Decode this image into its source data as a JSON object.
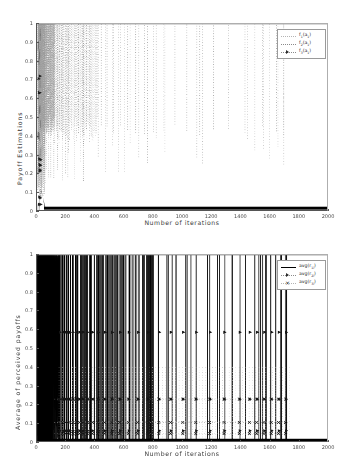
{
  "figures": [
    {
      "id": "payoff-estimations",
      "chart_data": {
        "type": "line",
        "title": "",
        "xlabel": "Number of iterations",
        "ylabel": "Payoff Estimations",
        "xlim": [
          0,
          2000
        ],
        "ylim": [
          0,
          1
        ],
        "xticks": [
          0,
          200,
          400,
          600,
          800,
          1000,
          1200,
          1400,
          1600,
          1800,
          2000
        ],
        "xticklabels": [
          "0",
          "200",
          "400",
          "600",
          "800",
          "1000",
          "1200",
          "1400",
          "1600",
          "1800",
          "2000"
        ],
        "yticks": [
          0,
          0.1,
          0.2,
          0.3,
          0.4,
          0.5,
          0.6,
          0.7,
          0.8,
          0.9,
          1
        ],
        "yticklabels": [
          "0",
          "0.1",
          "0.2",
          "0.3",
          "0.4",
          "0.5",
          "0.6",
          "0.7",
          "0.8",
          "0.9",
          "1"
        ],
        "grid": false,
        "legend_position": "upper right",
        "legend": [
          {
            "label": "f1(a1)",
            "style": "dotted",
            "marker": "none",
            "color": "#b4b4b4"
          },
          {
            "label": "f2(a1)",
            "style": "dotted",
            "marker": "none",
            "color": "#9e9e9e"
          },
          {
            "label": "f3(a1)",
            "style": "dotted",
            "marker": "triangle",
            "color": "#8a8a8a"
          }
        ],
        "series": [
          {
            "name": "f1(a1)",
            "description": "Dense dotted vertical excursions spanning 0.4 to 1.0, concentrated below 400 iterations and thinning out to isolated spikes up to 1700 iterations",
            "spike_x": [
              8,
              12,
              15,
              18,
              21,
              24,
              27,
              30,
              33,
              36,
              39,
              42,
              45,
              48,
              52,
              56,
              60,
              64,
              68,
              73,
              78,
              84,
              90,
              97,
              104,
              112,
              121,
              131,
              142,
              154,
              168,
              183,
              200,
              218,
              238,
              260,
              284,
              310,
              339,
              370,
              404,
              441,
              481,
              525,
              572,
              623,
              678,
              738,
              803,
              873,
              949,
              1031,
              1120,
              1216,
              1320,
              1432,
              1553,
              1650,
              1700
            ],
            "spike_low": 0.4,
            "spike_high": 1.0
          },
          {
            "name": "f2(a1)",
            "description": "Dotted trace clustered near the left edge with points between 0.15 and 1.0",
            "spike_x": [
              6,
              10,
              14,
              19,
              25,
              32,
              40,
              50,
              62,
              76,
              93,
              114,
              140,
              172,
              211,
              259,
              318
            ],
            "spike_low": 0.15,
            "spike_high": 1.0
          },
          {
            "name": "f3(a1)",
            "description": "Triangle-marked samples near the left axis at roughly 0.72, 0.63, 0.27, 0.24, 0.21, 0.07, 0.03 then collapsing onto the zero baseline",
            "marker_points": [
              {
                "x": 22,
                "y": 0.72
              },
              {
                "x": 20,
                "y": 0.63
              },
              {
                "x": 26,
                "y": 0.27
              },
              {
                "x": 24,
                "y": 0.24
              },
              {
                "x": 22,
                "y": 0.215
              },
              {
                "x": 18,
                "y": 0.07
              },
              {
                "x": 16,
                "y": 0.03
              }
            ],
            "baseline_y": 0.012,
            "baseline_from_x": 60,
            "baseline_to_x": 2000
          }
        ]
      }
    },
    {
      "id": "average-perceived-payoffs",
      "chart_data": {
        "type": "line",
        "title": "",
        "xlabel": "Number of iterations",
        "ylabel": "Average of perceived payoffs",
        "xlim": [
          0,
          2000
        ],
        "ylim": [
          0,
          1
        ],
        "xticks": [
          0,
          200,
          400,
          600,
          800,
          1000,
          1200,
          1400,
          1600,
          1800,
          2000
        ],
        "xticklabels": [
          "0",
          "200",
          "400",
          "600",
          "800",
          "1000",
          "1200",
          "1400",
          "1600",
          "1800",
          "2000"
        ],
        "yticks": [
          0,
          0.1,
          0.2,
          0.3,
          0.4,
          0.5,
          0.6,
          0.7,
          0.8,
          0.9,
          1
        ],
        "yticklabels": [
          "0",
          "0.1",
          "0.2",
          "0.3",
          "0.4",
          "0.5",
          "0.6",
          "0.7",
          "0.8",
          "0.9",
          "1"
        ],
        "grid": false,
        "legend_position": "upper right",
        "legend": [
          {
            "label": "avg(r1i)",
            "style": "solid",
            "marker": "none",
            "color": "#000000"
          },
          {
            "label": "avg(r2i)",
            "style": "dashed",
            "marker": "triangle",
            "color": "#2b2b2b"
          },
          {
            "label": "avg(r3i)",
            "style": "dotted",
            "marker": "x",
            "color": "#2b2b2b"
          }
        ],
        "series": [
          {
            "name": "avg(r1i)",
            "description": "Solid black vertical spikes running the full 0 to 1 range; extremely dense before 200 iterations, gradually sparser, last spike near 1720",
            "spike_x": [
              6,
              9,
              12,
              14,
              16,
              18,
              20,
              22,
              24,
              26,
              28,
              30,
              32,
              34,
              36,
              38,
              40,
              42,
              44,
              47,
              50,
              53,
              56,
              59,
              62,
              66,
              70,
              74,
              78,
              83,
              88,
              93,
              99,
              105,
              112,
              119,
              127,
              135,
              144,
              154,
              164,
              175,
              187,
              200,
              214,
              229,
              245,
              262,
              280,
              300,
              321,
              344,
              368,
              394,
              422,
              452,
              484,
              518,
              555,
              594,
              636,
              681,
              729,
              780,
              835,
              894,
              957,
              1024,
              1096,
              1173,
              1255,
              1343,
              1437,
              1500,
              1540,
              1575,
              1610,
              1645,
              1680,
              1720
            ],
            "spike_low": 0.0,
            "spike_high": 1.0
          },
          {
            "name": "avg(r2i)",
            "description": "Triangle markers at a steady level near 0.58 plus lower clusters near 0.22 and 0.05",
            "marker_levels": [
              0.585,
              0.225,
              0.055
            ],
            "marker_x": [
              160,
              185,
              200,
              215,
              230,
              250,
              270,
              295,
              320,
              350,
              385,
              425,
              470,
              520,
              575,
              635,
              700,
              770,
              845,
              925,
              1010,
              1100,
              1195,
              1295,
              1400,
              1470,
              1520,
              1570,
              1620,
              1670,
              1720
            ]
          },
          {
            "name": "avg(r3i)",
            "description": "Cross markers clustered near 0.22, 0.10 and 0.04 with dotted connectors",
            "marker_levels": [
              0.225,
              0.1,
              0.04
            ],
            "marker_x": [
              150,
              175,
              195,
              210,
              228,
              248,
              268,
              292,
              318,
              348,
              382,
              420,
              465,
              515,
              570,
              630,
              695,
              765,
              840,
              920,
              1005,
              1095,
              1190,
              1290,
              1395,
              1465,
              1515,
              1565,
              1615,
              1665,
              1715
            ]
          }
        ]
      }
    }
  ]
}
